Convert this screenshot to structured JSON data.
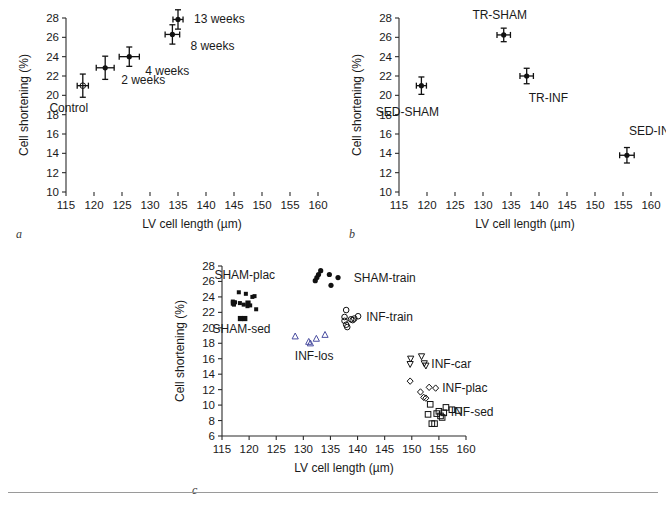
{
  "figure": {
    "background": "#ffffff",
    "rule_color": "#9a9a9a",
    "label_blue": "#3b3f8f"
  },
  "panels": [
    {
      "letter": "a",
      "x_label": "LV cell length (µm)",
      "y_label": "Cell shortening (%)",
      "x_ticks": [
        115,
        120,
        125,
        130,
        135,
        140,
        145,
        150,
        155,
        160
      ],
      "y_ticks": [
        10,
        12,
        14,
        16,
        18,
        20,
        22,
        24,
        26,
        28
      ],
      "xlim": [
        115,
        160
      ],
      "ylim": [
        10,
        28
      ],
      "axis_gradient": true
    },
    {
      "letter": "b",
      "x_label": "LV cell length (µm)",
      "y_label": "Cell shortening (%)",
      "x_ticks": [
        115,
        120,
        125,
        130,
        135,
        140,
        145,
        150,
        155,
        160
      ],
      "y_ticks": [
        10,
        12,
        14,
        16,
        18,
        20,
        22,
        24,
        26,
        28
      ],
      "xlim": [
        115,
        160
      ],
      "ylim": [
        10,
        28
      ],
      "axis_gradient": true
    },
    {
      "letter": "c",
      "x_label": "LV cell length (µm)",
      "y_label": "Cell shortening (%)",
      "x_ticks": [
        115,
        120,
        125,
        130,
        135,
        140,
        145,
        150,
        155,
        160
      ],
      "y_ticks": [
        6,
        8,
        10,
        12,
        14,
        16,
        18,
        20,
        22,
        24,
        26,
        28
      ],
      "xlim": [
        115,
        160
      ],
      "ylim": [
        6,
        28
      ],
      "axis_gradient": false
    }
  ],
  "chart_data": [
    {
      "type": "scatter",
      "panel": "a",
      "title": "",
      "xlabel": "LV cell length (µm)",
      "ylabel": "Cell shortening (%)",
      "xlim": [
        115,
        160
      ],
      "ylim": [
        10,
        28
      ],
      "xticks": [
        115,
        120,
        125,
        130,
        135,
        140,
        145,
        150,
        155,
        160
      ],
      "yticks": [
        10,
        12,
        14,
        16,
        18,
        20,
        22,
        24,
        26,
        28
      ],
      "grid": false,
      "legend": "inline-annotations",
      "points": [
        {
          "label": "Control",
          "x": 118.0,
          "y": 21.0,
          "xerr": 1.0,
          "yerr": 1.2,
          "marker": "open-circle",
          "label_dx": -14,
          "label_dy": 26
        },
        {
          "label": "2 weeks",
          "x": 122.0,
          "y": 22.85,
          "xerr": 1.6,
          "yerr": 1.2,
          "marker": "filled-circle",
          "label_dx": 16,
          "label_dy": 16
        },
        {
          "label": "4 weeks",
          "x": 126.3,
          "y": 24.0,
          "xerr": 1.8,
          "yerr": 1.0,
          "marker": "filled-circle",
          "label_dx": 16,
          "label_dy": 18
        },
        {
          "label": "8 weeks",
          "x": 134.0,
          "y": 26.3,
          "xerr": 1.3,
          "yerr": 1.0,
          "marker": "filled-circle",
          "label_dx": 18,
          "label_dy": 16
        },
        {
          "label": "13 weeks",
          "x": 135.0,
          "y": 27.85,
          "xerr": 0.9,
          "yerr": 1.0,
          "marker": "filled-circle",
          "label_dx": 16,
          "label_dy": 4
        }
      ]
    },
    {
      "type": "scatter",
      "panel": "b",
      "title": "",
      "xlabel": "LV cell length (µm)",
      "ylabel": "Cell shortening (%)",
      "xlim": [
        115,
        160
      ],
      "ylim": [
        10,
        28
      ],
      "xticks": [
        115,
        120,
        125,
        130,
        135,
        140,
        145,
        150,
        155,
        160
      ],
      "yticks": [
        10,
        12,
        14,
        16,
        18,
        20,
        22,
        24,
        26,
        28
      ],
      "grid": false,
      "legend": "inline-annotations",
      "points": [
        {
          "label": "SED-SHAM",
          "x": 119.0,
          "y": 21.0,
          "xerr": 0.9,
          "yerr": 0.9,
          "marker": "filled-circle",
          "label_dx": -14,
          "label_dy": 30
        },
        {
          "label": "TR-SHAM",
          "x": 133.7,
          "y": 26.25,
          "xerr": 1.2,
          "yerr": 0.7,
          "marker": "filled-circle",
          "label_dx": -4,
          "label_dy": -16
        },
        {
          "label": "TR-INF",
          "x": 137.8,
          "y": 22.0,
          "xerr": 1.2,
          "yerr": 0.8,
          "marker": "filled-circle",
          "label_dx": 2,
          "label_dy": 26
        },
        {
          "label": "SED-INF",
          "x": 155.7,
          "y": 13.8,
          "xerr": 1.3,
          "yerr": 0.8,
          "marker": "filled-circle",
          "label_dx": 2,
          "label_dy": -20
        }
      ]
    },
    {
      "type": "scatter",
      "panel": "c",
      "title": "",
      "xlabel": "LV cell length (µm)",
      "ylabel": "Cell shortening (%)",
      "xlim": [
        115,
        160
      ],
      "ylim": [
        6,
        28
      ],
      "xticks": [
        115,
        120,
        125,
        130,
        135,
        140,
        145,
        150,
        155,
        160
      ],
      "yticks": [
        6,
        8,
        10,
        12,
        14,
        16,
        18,
        20,
        22,
        24,
        26,
        28
      ],
      "grid": false,
      "legend": "inline-annotations",
      "series": [
        {
          "name": "SHAM-plac",
          "marker": "small-filled-square",
          "color": "#111111",
          "label_color": "#1a1a1a",
          "label_x": 119.2,
          "label_y": 26.9,
          "label_anchor": "middle",
          "points": [
            {
              "x": 117.0,
              "y": 23.4
            },
            {
              "x": 117.2,
              "y": 23.0
            },
            {
              "x": 117.4,
              "y": 23.3
            },
            {
              "x": 118.1,
              "y": 24.6
            },
            {
              "x": 118.3,
              "y": 23.2
            },
            {
              "x": 119.0,
              "y": 23.0
            },
            {
              "x": 119.4,
              "y": 24.4
            },
            {
              "x": 119.7,
              "y": 22.8
            },
            {
              "x": 120.6,
              "y": 24.0
            },
            {
              "x": 121.0,
              "y": 24.1
            },
            {
              "x": 120.2,
              "y": 22.9
            },
            {
              "x": 121.3,
              "y": 22.4
            }
          ]
        },
        {
          "name": "SHAM-sed",
          "marker": "filled-square",
          "color": "#111111",
          "label_color": "#3b3f8f",
          "label_x": 118.6,
          "label_y": 19.8,
          "label_anchor": "middle",
          "points": [
            {
              "x": 118.4,
              "y": 21.2
            },
            {
              "x": 119.2,
              "y": 21.2
            },
            {
              "x": 117.1,
              "y": 23.2
            },
            {
              "x": 119.8,
              "y": 23.2
            }
          ]
        },
        {
          "name": "SHAM-train",
          "marker": "filled-circle",
          "color": "#111111",
          "label_color": "#1a1a1a",
          "label_x": 139.3,
          "label_y": 26.5,
          "label_anchor": "start",
          "points": [
            {
              "x": 132.2,
              "y": 26.1
            },
            {
              "x": 132.5,
              "y": 26.5
            },
            {
              "x": 132.8,
              "y": 26.9
            },
            {
              "x": 133.2,
              "y": 27.4
            },
            {
              "x": 134.8,
              "y": 26.9
            },
            {
              "x": 135.1,
              "y": 25.5
            },
            {
              "x": 136.4,
              "y": 26.5
            }
          ]
        },
        {
          "name": "INF-train",
          "marker": "open-circle",
          "color": "#111111",
          "label_color": "#1a1a1a",
          "label_x": 141.6,
          "label_y": 21.4,
          "label_anchor": "start",
          "points": [
            {
              "x": 137.9,
              "y": 22.3
            },
            {
              "x": 137.6,
              "y": 21.4
            },
            {
              "x": 137.6,
              "y": 20.9
            },
            {
              "x": 137.9,
              "y": 20.4
            },
            {
              "x": 138.1,
              "y": 20.1
            },
            {
              "x": 138.8,
              "y": 21.1
            },
            {
              "x": 139.1,
              "y": 21.0
            },
            {
              "x": 139.4,
              "y": 21.2
            },
            {
              "x": 140.1,
              "y": 21.5
            }
          ]
        },
        {
          "name": "INF-los",
          "marker": "open-triangle",
          "color": "#4a4ea0",
          "label_color": "#1a1a1a",
          "label_x": 132.0,
          "label_y": 16.3,
          "label_anchor": "middle",
          "points": [
            {
              "x": 128.5,
              "y": 18.9
            },
            {
              "x": 131.0,
              "y": 18.2
            },
            {
              "x": 131.3,
              "y": 18.0
            },
            {
              "x": 132.4,
              "y": 18.6
            },
            {
              "x": 134.0,
              "y": 19.1
            }
          ]
        },
        {
          "name": "INF-car",
          "marker": "open-down-triangle",
          "color": "#111111",
          "label_color": "#1a1a1a",
          "label_x": 153.6,
          "label_y": 15.3,
          "label_anchor": "start",
          "points": [
            {
              "x": 149.8,
              "y": 16.0
            },
            {
              "x": 149.7,
              "y": 15.3
            },
            {
              "x": 151.8,
              "y": 16.3
            },
            {
              "x": 152.3,
              "y": 15.4
            },
            {
              "x": 152.6,
              "y": 15.1
            }
          ]
        },
        {
          "name": "INF-plac",
          "marker": "open-diamond",
          "color": "#111111",
          "label_color": "#1a1a1a",
          "label_x": 155.6,
          "label_y": 12.2,
          "label_anchor": "start",
          "points": [
            {
              "x": 149.7,
              "y": 13.1
            },
            {
              "x": 151.6,
              "y": 11.7
            },
            {
              "x": 152.2,
              "y": 11.0
            },
            {
              "x": 152.6,
              "y": 10.9
            },
            {
              "x": 153.2,
              "y": 12.3
            },
            {
              "x": 154.4,
              "y": 12.2
            }
          ]
        },
        {
          "name": "INF-sed",
          "marker": "open-square",
          "color": "#111111",
          "label_color": "#1a1a1a",
          "label_x": 157.2,
          "label_y": 9.1,
          "label_anchor": "start",
          "points": [
            {
              "x": 153.4,
              "y": 10.1
            },
            {
              "x": 153.0,
              "y": 8.8
            },
            {
              "x": 153.7,
              "y": 7.6
            },
            {
              "x": 154.2,
              "y": 7.6
            },
            {
              "x": 154.6,
              "y": 8.9
            },
            {
              "x": 155.0,
              "y": 9.2
            },
            {
              "x": 155.3,
              "y": 8.6
            },
            {
              "x": 155.6,
              "y": 8.4
            },
            {
              "x": 155.9,
              "y": 9.0
            },
            {
              "x": 156.3,
              "y": 9.7
            },
            {
              "x": 157.4,
              "y": 9.4
            },
            {
              "x": 158.6,
              "y": 9.3
            }
          ]
        }
      ]
    }
  ]
}
